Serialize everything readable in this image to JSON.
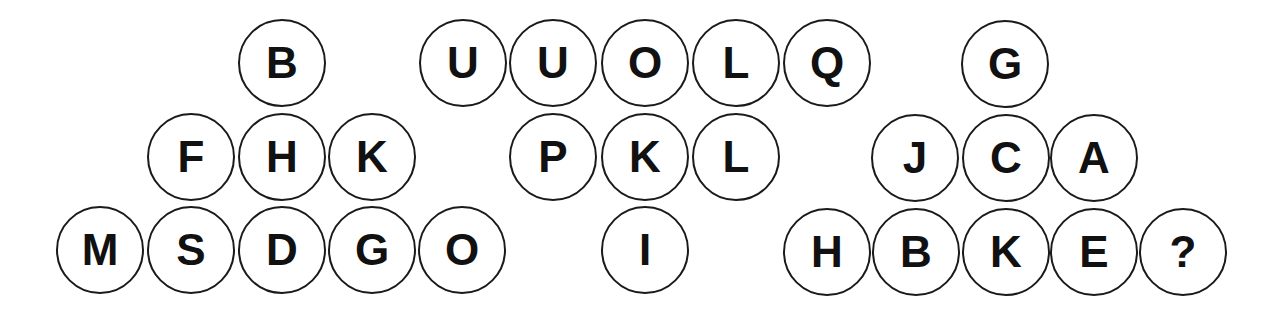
{
  "puzzle": {
    "type": "letter-circle-triangle-puzzle",
    "groups": [
      {
        "name": "left-group",
        "circles": [
          {
            "letter": "B",
            "x": 282,
            "y": 63
          },
          {
            "letter": "F",
            "x": 191,
            "y": 157
          },
          {
            "letter": "H",
            "x": 282,
            "y": 157
          },
          {
            "letter": "K",
            "x": 372,
            "y": 157
          },
          {
            "letter": "M",
            "x": 100,
            "y": 250
          },
          {
            "letter": "S",
            "x": 191,
            "y": 250
          },
          {
            "letter": "D",
            "x": 282,
            "y": 250
          },
          {
            "letter": "G",
            "x": 372,
            "y": 250
          },
          {
            "letter": "O",
            "x": 462,
            "y": 250
          }
        ]
      },
      {
        "name": "middle-group",
        "circles": [
          {
            "letter": "U",
            "x": 463,
            "y": 63
          },
          {
            "letter": "U",
            "x": 553,
            "y": 63
          },
          {
            "letter": "O",
            "x": 645,
            "y": 63
          },
          {
            "letter": "L",
            "x": 736,
            "y": 63
          },
          {
            "letter": "Q",
            "x": 827,
            "y": 63
          },
          {
            "letter": "P",
            "x": 553,
            "y": 157
          },
          {
            "letter": "K",
            "x": 645,
            "y": 157
          },
          {
            "letter": "L",
            "x": 736,
            "y": 157
          },
          {
            "letter": "I",
            "x": 645,
            "y": 250
          }
        ]
      },
      {
        "name": "right-group",
        "circles": [
          {
            "letter": "G",
            "x": 1005,
            "y": 64
          },
          {
            "letter": "J",
            "x": 915,
            "y": 158
          },
          {
            "letter": "C",
            "x": 1006,
            "y": 158
          },
          {
            "letter": "A",
            "x": 1094,
            "y": 158
          },
          {
            "letter": "H",
            "x": 827,
            "y": 252
          },
          {
            "letter": "B",
            "x": 916,
            "y": 252
          },
          {
            "letter": "K",
            "x": 1006,
            "y": 252
          },
          {
            "letter": "E",
            "x": 1094,
            "y": 252
          },
          {
            "letter": "?",
            "x": 1183,
            "y": 252
          }
        ]
      }
    ],
    "colors": {
      "stroke": "#1a1a1a",
      "text": "#111111",
      "background": "#ffffff"
    }
  }
}
